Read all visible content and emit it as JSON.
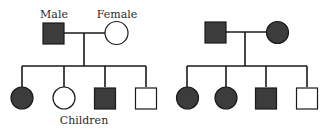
{
  "diagram": {
    "type": "pedigree",
    "colors": {
      "affected_fill": "#3c3c3c",
      "unaffected_fill": "#ffffff",
      "stroke": "#1a1a1a"
    },
    "labels": {
      "male": "Male",
      "female": "Female",
      "children": "Children"
    },
    "families": [
      {
        "id": "family-left",
        "parents": [
          {
            "sex": "male",
            "affected": true
          },
          {
            "sex": "female",
            "affected": false
          }
        ],
        "children": [
          {
            "sex": "female",
            "affected": true
          },
          {
            "sex": "female",
            "affected": false
          },
          {
            "sex": "male",
            "affected": true
          },
          {
            "sex": "male",
            "affected": false
          }
        ]
      },
      {
        "id": "family-right",
        "parents": [
          {
            "sex": "male",
            "affected": true
          },
          {
            "sex": "female",
            "affected": true
          }
        ],
        "children": [
          {
            "sex": "female",
            "affected": true
          },
          {
            "sex": "female",
            "affected": true
          },
          {
            "sex": "male",
            "affected": true
          },
          {
            "sex": "male",
            "affected": false
          }
        ]
      }
    ]
  }
}
